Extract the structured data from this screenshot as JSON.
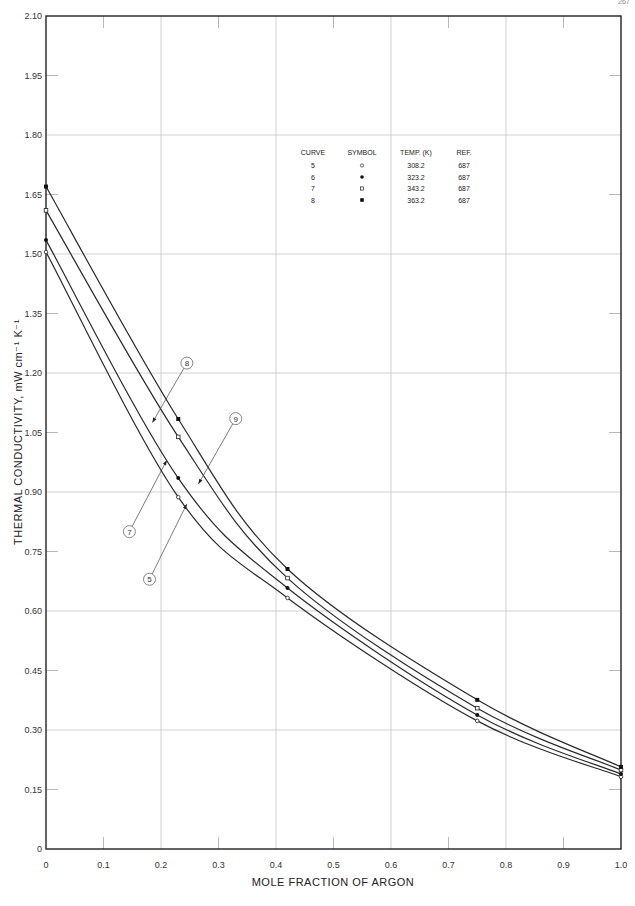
{
  "page": {
    "number": "267"
  },
  "chart_data": {
    "type": "line",
    "title": "",
    "xlabel": "MOLE FRACTION OF ARGON",
    "ylabel": "THERMAL CONDUCTIVITY, mW cm⁻¹ K⁻¹",
    "xlim": [
      0,
      1.0
    ],
    "ylim": [
      0,
      2.1
    ],
    "x_ticks": [
      "0",
      "0.1",
      "0.2",
      "0.3",
      "0.4",
      "0.5",
      "0.6",
      "0.7",
      "0.8",
      "0.9",
      "1.0"
    ],
    "y_ticks": [
      "0",
      "0.15",
      "0.30",
      "0.45",
      "0.60",
      "0.75",
      "0.90",
      "1.05",
      "1.20",
      "1.35",
      "1.50",
      "1.65",
      "1.80",
      "1.95",
      "2.10"
    ],
    "grid": true,
    "legend_position": "upper right (inside plot)",
    "legend": {
      "headers": [
        "CURVE",
        "SYMBOL",
        "TEMP. (K)",
        "REF."
      ],
      "rows": [
        {
          "curve": "5",
          "symbol": "open-circle",
          "symbol_glyph": "◦",
          "temp": "308.2",
          "ref": "687"
        },
        {
          "curve": "6",
          "symbol": "filled-circle",
          "symbol_glyph": "•",
          "temp": "323.2",
          "ref": "687"
        },
        {
          "curve": "7",
          "symbol": "open-square",
          "symbol_glyph": "▫",
          "temp": "343.2",
          "ref": "687"
        },
        {
          "curve": "8",
          "symbol": "filled-square",
          "symbol_glyph": "▪",
          "temp": "363.2",
          "ref": "687"
        }
      ]
    },
    "x": [
      0,
      0.23,
      0.42,
      0.75,
      1.0
    ],
    "series": [
      {
        "name": "Curve 5 (308.2 K)",
        "symbol": "open-circle",
        "values": [
          1.505,
          0.887,
          0.633,
          0.323,
          0.182
        ]
      },
      {
        "name": "Curve 6 (323.2 K)",
        "symbol": "filled-circle",
        "values": [
          1.535,
          0.935,
          0.658,
          0.338,
          0.189
        ]
      },
      {
        "name": "Curve 7 (343.2 K)",
        "symbol": "open-square",
        "values": [
          1.61,
          1.039,
          0.683,
          0.355,
          0.199
        ]
      },
      {
        "name": "Curve 8 (363.2 K)",
        "symbol": "filled-square",
        "values": [
          1.67,
          1.084,
          0.706,
          0.376,
          0.207
        ]
      }
    ],
    "annotations": [
      {
        "label": "8",
        "text_pos": [
          0.245,
          1.225
        ],
        "arrow_to": [
          0.185,
          1.075
        ]
      },
      {
        "label": "9",
        "text_pos": [
          0.33,
          1.085
        ],
        "arrow_to": [
          0.265,
          0.92
        ]
      },
      {
        "label": "7",
        "text_pos": [
          0.145,
          0.8
        ],
        "arrow_to": [
          0.21,
          0.98
        ]
      },
      {
        "label": "5",
        "text_pos": [
          0.18,
          0.68
        ],
        "arrow_to": [
          0.245,
          0.87
        ]
      }
    ]
  }
}
